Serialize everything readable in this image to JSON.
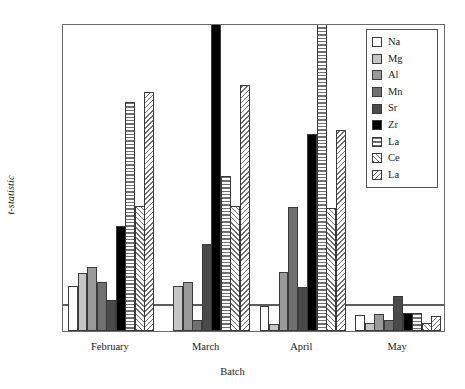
{
  "chart_data": {
    "type": "bar",
    "title": "",
    "xlabel": "Batch",
    "ylabel": "t-statistic",
    "ylim": [
      0,
      40
    ],
    "yticks": [
      0,
      5,
      10,
      15,
      20,
      25,
      30,
      35,
      40
    ],
    "ytick_labels": [
      "0",
      "5",
      "10",
      "15",
      "20",
      "25",
      "30",
      "35",
      "40"
    ],
    "grid": false,
    "legend_position": "top-right",
    "categories": [
      "February",
      "March",
      "April",
      "May"
    ],
    "annotations": [
      {
        "name": "significance-threshold",
        "type": "hline",
        "value": 3.3
      }
    ],
    "series": [
      {
        "name": "Na",
        "fill": "white",
        "values": [
          5.8,
          0.0,
          3.2,
          2.1
        ]
      },
      {
        "name": "Mg",
        "fill": "light-grey",
        "values": [
          7.5,
          5.9,
          0.9,
          1.0
        ]
      },
      {
        "name": "Al",
        "fill": "mid-grey",
        "values": [
          8.3,
          6.4,
          7.6,
          2.2
        ]
      },
      {
        "name": "Mn",
        "fill": "dark-grey",
        "values": [
          6.4,
          1.4,
          16.1,
          1.4
        ]
      },
      {
        "name": "Sr",
        "fill": "darker-grey",
        "values": [
          4.0,
          11.3,
          5.7,
          4.6
        ]
      },
      {
        "name": "Zr",
        "fill": "black",
        "values": [
          13.6,
          40.0,
          25.6,
          2.4
        ]
      },
      {
        "name": "La",
        "fill": "horizontal-hatch",
        "values": [
          29.8,
          20.1,
          40.0,
          2.3
        ]
      },
      {
        "name": "Ce",
        "fill": "forward-hatch",
        "values": [
          16.3,
          16.2,
          16.0,
          1.1
        ]
      },
      {
        "name": "La",
        "fill": "back-hatch",
        "values": [
          31.0,
          32.0,
          26.1,
          1.9
        ]
      }
    ]
  },
  "legend": {
    "entries": [
      {
        "label": "Na"
      },
      {
        "label": "Mg"
      },
      {
        "label": "Al"
      },
      {
        "label": "Mn"
      },
      {
        "label": "Sr"
      },
      {
        "label": "Zr"
      },
      {
        "label": "La"
      },
      {
        "label": "Ce"
      },
      {
        "label": "La"
      }
    ]
  },
  "colors": {
    "frame": "#6a6a6a",
    "bar_outline": "#3a3a3a",
    "threshold": "#5d5d5d",
    "na": "#ffffff",
    "mg": "#c6c6c6",
    "al": "#9a9a9a",
    "mn": "#707070",
    "sr": "#4a4a4a",
    "zr": "#000000",
    "hatch": "#6f6f6f"
  }
}
